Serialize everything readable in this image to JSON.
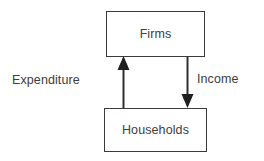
{
  "diagram": {
    "background_color": "#ffffff",
    "stroke_color": "#3a3a3a",
    "text_color": "#404040",
    "nodes": [
      {
        "id": "firms",
        "label": "Firms"
      },
      {
        "id": "households",
        "label": "Households"
      }
    ],
    "edges": [
      {
        "id": "expenditure",
        "label": "Expenditure",
        "from": "households",
        "to": "firms",
        "direction": "up",
        "arrowhead": "firms"
      },
      {
        "id": "income",
        "label": "Income",
        "from": "firms",
        "to": "households",
        "direction": "down",
        "arrowhead": "households"
      }
    ]
  }
}
